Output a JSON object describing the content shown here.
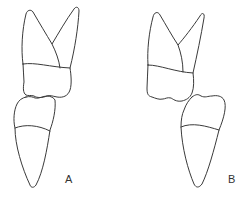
{
  "figure": {
    "panels": [
      {
        "id": "A",
        "label": "A"
      },
      {
        "id": "B",
        "label": "B"
      }
    ],
    "colors": {
      "stroke": "#3a3a3a",
      "background": "#ffffff"
    }
  }
}
